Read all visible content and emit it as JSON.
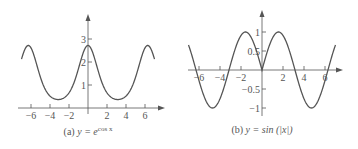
{
  "chart_data": [
    {
      "type": "line",
      "title": "(a) y = e^(cos x)",
      "caption_prefix": "(a) ",
      "caption_main": "y = e",
      "caption_sup": "cos x",
      "function": "exp(cos(x))",
      "xlabel": "",
      "ylabel": "",
      "xlim": [
        -7,
        7
      ],
      "ylim": [
        0,
        3.2
      ],
      "x_ticks": [
        -6,
        -4,
        -2,
        2,
        4,
        6
      ],
      "x_tick_labels": [
        "−6",
        "−4",
        "−2",
        "2",
        "4",
        "6"
      ],
      "y_ticks": [
        1,
        2,
        3
      ],
      "y_tick_labels": [
        "1",
        "2",
        "3"
      ],
      "grid": false,
      "series": [
        {
          "name": "e^cos x",
          "x": [
            -7,
            -6.28,
            -5,
            -3.14,
            -2,
            -1,
            0,
            1,
            2,
            3.14,
            5,
            6.28,
            7
          ],
          "values": [
            2.13,
            2.72,
            1.33,
            0.37,
            0.66,
            1.72,
            2.72,
            1.72,
            0.66,
            0.37,
            1.33,
            2.72,
            2.13
          ]
        }
      ]
    },
    {
      "type": "line",
      "title": "(b) y = sin (|x|)",
      "caption_prefix": "(b) ",
      "caption_main": "y = sin (|x|)",
      "caption_sup": "",
      "function": "sin(abs(x))",
      "xlabel": "",
      "ylabel": "",
      "xlim": [
        -7,
        7
      ],
      "ylim": [
        -1.2,
        1.2
      ],
      "x_ticks": [
        -6,
        -4,
        -2,
        2,
        4,
        6
      ],
      "x_tick_labels": [
        "−6",
        "−4",
        "−2",
        "2",
        "4",
        "6"
      ],
      "y_ticks": [
        -1,
        -0.5,
        0.5,
        1
      ],
      "y_tick_labels": [
        "−1",
        "−0.5",
        "0.5",
        "1"
      ],
      "grid": false,
      "series": [
        {
          "name": "sin|x|",
          "x": [
            -7,
            -6.28,
            -4.71,
            -3.14,
            -1.57,
            0,
            1.57,
            3.14,
            4.71,
            6.28,
            7
          ],
          "values": [
            0.66,
            0,
            -1,
            0,
            1,
            0,
            1,
            0,
            -1,
            0,
            0.66
          ]
        }
      ]
    }
  ],
  "colors": {
    "curve": "#555555",
    "axis": "#555555"
  }
}
